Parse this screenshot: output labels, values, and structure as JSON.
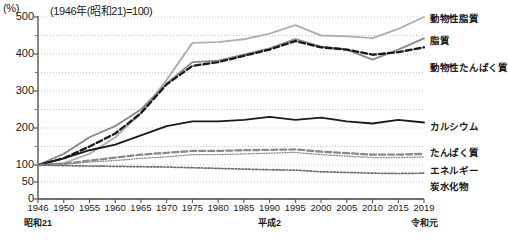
{
  "unit": "(%)",
  "title": "(1946年(昭和21)=100)",
  "axes": {
    "y_ticks": [
      "0",
      "50",
      "100",
      "200",
      "300",
      "400",
      "500"
    ],
    "x_ticks": [
      "1946",
      "1950",
      "1955",
      "1960",
      "1965",
      "1970",
      "1975",
      "1980",
      "1985",
      "1990",
      "1995",
      "2000",
      "2005",
      "2010",
      "2015",
      "2019"
    ],
    "era_labels": [
      {
        "text": "昭和21",
        "year": 1946
      },
      {
        "text": "平成2",
        "year": 1990
      },
      {
        "text": "令和元",
        "year": 2019
      }
    ]
  },
  "legend": [
    {
      "name": "animal-fat",
      "label": "動物性脂質"
    },
    {
      "name": "fat",
      "label": "脂質"
    },
    {
      "name": "animal-protein",
      "label": "動物性たんぱく質"
    },
    {
      "name": "calcium",
      "label": "カルシウム"
    },
    {
      "name": "protein",
      "label": "たんぱく質"
    },
    {
      "name": "energy",
      "label": "エネルギー"
    },
    {
      "name": "carbohydrate",
      "label": "炭水化物"
    }
  ],
  "chart_data": {
    "type": "line",
    "title": "(1946年(昭和21)=100)",
    "xlabel": "",
    "ylabel": "(%)",
    "ylim": [
      0,
      500
    ],
    "xlim": [
      1946,
      2019
    ],
    "grid": true,
    "grid_interval": 50,
    "legend_position": "right",
    "x": [
      1946,
      1950,
      1955,
      1960,
      1965,
      1970,
      1975,
      1980,
      1985,
      1990,
      1995,
      2000,
      2005,
      2010,
      2015,
      2019
    ],
    "series": [
      {
        "name": "動物性脂質",
        "style": "solid",
        "color": "#b0b0b0",
        "values": [
          100,
          105,
          130,
          175,
          240,
          330,
          430,
          432,
          440,
          455,
          478,
          450,
          448,
          443,
          468,
          500
        ]
      },
      {
        "name": "脂質",
        "style": "solid",
        "color": "#8a8a8a",
        "values": [
          100,
          130,
          175,
          205,
          250,
          320,
          378,
          382,
          398,
          415,
          440,
          420,
          412,
          385,
          412,
          442
        ]
      },
      {
        "name": "動物性たんぱく質",
        "style": "dashed",
        "color": "#1a1a1a",
        "values": [
          100,
          118,
          150,
          185,
          240,
          318,
          368,
          378,
          395,
          412,
          435,
          418,
          412,
          398,
          405,
          418
        ]
      },
      {
        "name": "カルシウム",
        "style": "solid",
        "color": "#1a1a1a",
        "values": [
          100,
          118,
          140,
          155,
          180,
          205,
          218,
          218,
          222,
          230,
          222,
          228,
          218,
          212,
          222,
          215
        ]
      },
      {
        "name": "たんぱく質",
        "style": "fine-dotted",
        "color": "#8a8a8a",
        "values": [
          100,
          102,
          108,
          112,
          118,
          122,
          128,
          128,
          130,
          132,
          134,
          128,
          124,
          120,
          120,
          122
        ]
      },
      {
        "name": "エネルギー",
        "style": "dashed",
        "color": "#8a8a8a",
        "values": [
          100,
          103,
          112,
          120,
          128,
          133,
          138,
          138,
          140,
          141,
          142,
          136,
          132,
          128,
          128,
          130
        ]
      },
      {
        "name": "炭水化物",
        "style": "dotted",
        "color": "#6e6e6e",
        "values": [
          100,
          98,
          97,
          96,
          95,
          94,
          92,
          90,
          88,
          86,
          85,
          80,
          78,
          76,
          75,
          76
        ]
      }
    ]
  }
}
